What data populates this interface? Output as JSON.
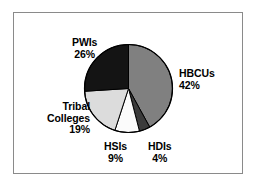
{
  "chart_data": {
    "type": "pie",
    "title": "",
    "subtitle": "",
    "xlabel": "",
    "ylabel": "",
    "legend_position": "none",
    "grid": false,
    "units": "percent",
    "start_angle_deg": 0,
    "direction": "clockwise",
    "categories": [
      "HBCUs",
      "HDIs",
      "HSIs",
      "Tribal Colleges",
      "PWIs"
    ],
    "values": [
      42,
      4,
      9,
      19,
      26
    ],
    "slices": [
      {
        "label": "HBCUs",
        "value": 42,
        "value_text": "42%",
        "color": "#808080",
        "label_align": "left"
      },
      {
        "label": "HDIs",
        "value": 4,
        "value_text": "4%",
        "color": "#3b3b3b",
        "label_align": "center"
      },
      {
        "label": "HSIs",
        "value": 9,
        "value_text": "9%",
        "color": "#fbfbfb",
        "label_align": "center"
      },
      {
        "label": "Tribal Colleges",
        "label_line1": "Tribal",
        "label_line2": "Colleges",
        "value": 19,
        "value_text": "19%",
        "color": "#dcdcdc",
        "label_align": "right"
      },
      {
        "label": "PWIs",
        "value": 26,
        "value_text": "26%",
        "color": "#141414",
        "label_align": "center"
      }
    ]
  },
  "figure": {
    "frame_color": "#8a8a8a",
    "background": "#ffffff",
    "outline_color": "#000000"
  }
}
